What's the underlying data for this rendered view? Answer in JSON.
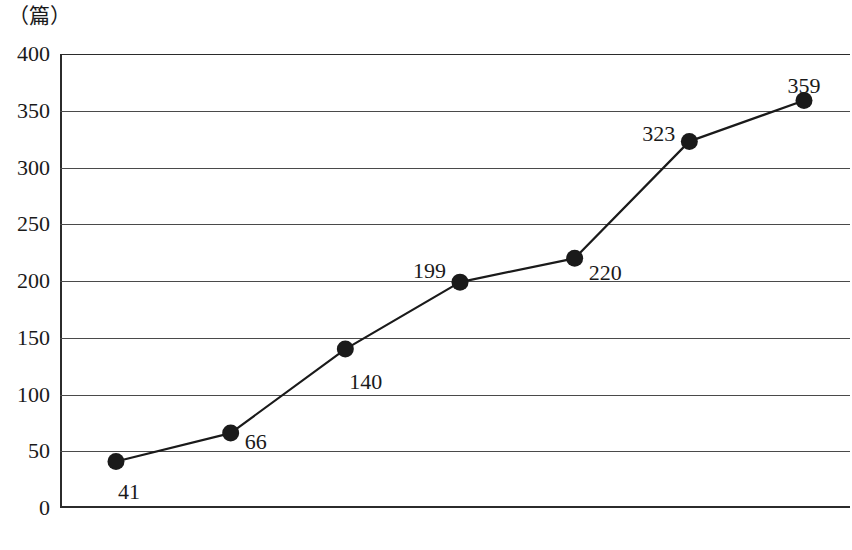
{
  "chart_data": {
    "type": "line",
    "title": "",
    "subtitle": "",
    "unit_caption": "（篇）",
    "xlabel": "",
    "ylabel": "（篇）",
    "categories": [
      "2000年",
      "2002年",
      "2004年",
      "2005年",
      "2006年",
      "2008年",
      "2010年"
    ],
    "values": [
      41,
      66,
      140,
      199,
      220,
      323,
      359
    ],
    "series": [
      {
        "name": "",
        "values": [
          41,
          66,
          140,
          199,
          220,
          323,
          359
        ]
      }
    ],
    "point_labels": [
      "41",
      "66",
      "140",
      "199",
      "220",
      "323",
      "359"
    ],
    "ylim": [
      0,
      400
    ],
    "ytick_values": [
      0,
      50,
      100,
      150,
      200,
      250,
      300,
      350,
      400
    ],
    "ytick_labels": [
      "0",
      "50",
      "100",
      "150",
      "200",
      "250",
      "300",
      "350",
      "400"
    ],
    "grid": true,
    "grid_orientation": "horizontal",
    "legend": false,
    "legend_position": "none",
    "marker": "filled-circle",
    "line_color": "#1a1a1a",
    "marker_color": "#1a1a1a",
    "background_color": "#ffffff"
  },
  "label_offsets": [
    {
      "dx": 2,
      "dy": 20,
      "align": "left"
    },
    {
      "dx": 14,
      "dy": -2,
      "align": "left"
    },
    {
      "dx": 4,
      "dy": 22,
      "align": "left"
    },
    {
      "dx": -14,
      "dy": -22,
      "align": "right"
    },
    {
      "dx": 14,
      "dy": 4,
      "align": "left"
    },
    {
      "dx": -14,
      "dy": -18,
      "align": "right"
    },
    {
      "dx": 0,
      "dy": -26,
      "align": "center"
    }
  ]
}
